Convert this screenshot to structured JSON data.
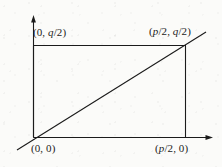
{
  "figure": {
    "name": "coordinate-rectangle-diagonal-diagram",
    "background_color": "#fbfbf9",
    "stroke_color": "#1b1b1b",
    "labels": {
      "origin": "(0, 0)",
      "top_left": "(0, q/2)",
      "top_right": "(p/2, q/2)",
      "bottom_right": "(p/2, 0)"
    },
    "axes": {
      "x_axis_name": "x-axis",
      "y_axis_name": "y-axis",
      "arrowheads": "both-axes"
    },
    "chart_data": {
      "type": "scatter",
      "title": "",
      "xlabel": "",
      "ylabel": "",
      "grid": false,
      "legend": "none",
      "xlim": [
        0,
        1
      ],
      "ylim": [
        0,
        1
      ],
      "points": [
        {
          "label": "(0, 0)",
          "x": 0,
          "y": 0
        },
        {
          "label": "(p/2, 0)",
          "x": 1,
          "y": 0
        },
        {
          "label": "(p/2, q/2)",
          "x": 1,
          "y": 1
        },
        {
          "label": "(0, q/2)",
          "x": 0,
          "y": 1
        }
      ],
      "shapes": [
        {
          "kind": "rectangle",
          "name": "rectangle-outline",
          "corners": [
            "(0, 0)",
            "(p/2, 0)",
            "(p/2, q/2)",
            "(0, q/2)"
          ]
        },
        {
          "kind": "line",
          "name": "diagonal-line",
          "through": [
            "(0, 0)",
            "(p/2, q/2)"
          ],
          "extends_beyond_endpoints": true
        }
      ]
    }
  }
}
